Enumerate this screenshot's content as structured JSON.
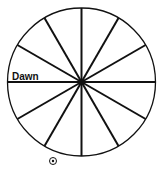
{
  "diagram": {
    "type": "clock-wheel",
    "center": [
      81.5,
      82
    ],
    "radius": 74,
    "spoke_count": 12,
    "spoke_angles_deg": [
      0,
      30,
      60,
      90,
      120,
      150,
      180,
      210,
      240,
      270,
      300,
      330
    ],
    "stroke_color": "#111111",
    "spoke_width": 2,
    "circle_width": 1.3
  },
  "labels": {
    "dawn": "Dawn"
  },
  "symbols": {
    "sun": {
      "name": "sun-icon",
      "glyph": "⊙",
      "position": [
        53,
        161
      ]
    }
  }
}
